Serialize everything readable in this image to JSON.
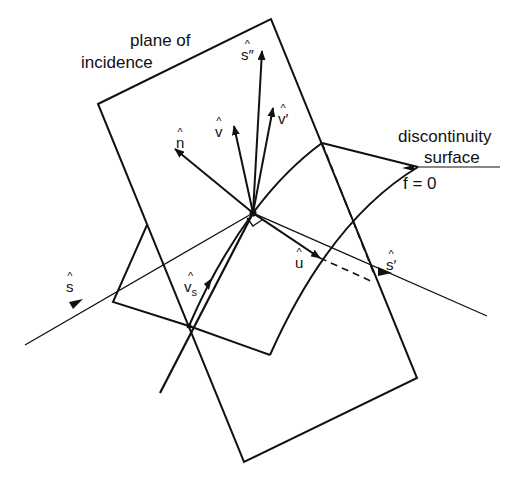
{
  "figure": {
    "labels": {
      "plane_line1": "plane of",
      "plane_line2": "incidence",
      "surface_line1": "discontinuity",
      "surface_line2": "surface",
      "equation": "f = 0"
    },
    "vectors": {
      "s_incident": {
        "hat": "^",
        "sym": "s"
      },
      "s_reflected": {
        "hat": "^",
        "sym": "s′"
      },
      "s_double": {
        "hat": "^",
        "sym": "s″"
      },
      "n": {
        "hat": "^",
        "sym": "n"
      },
      "v": {
        "hat": "^",
        "sym": "v"
      },
      "v_prime": {
        "hat": "^",
        "sym": "v′"
      },
      "u": {
        "hat": "^",
        "sym": "u"
      },
      "v_s": {
        "hat": "^",
        "sym": "v",
        "sub": "s"
      }
    },
    "colors": {
      "ink": "#111111",
      "background": "#ffffff"
    }
  }
}
